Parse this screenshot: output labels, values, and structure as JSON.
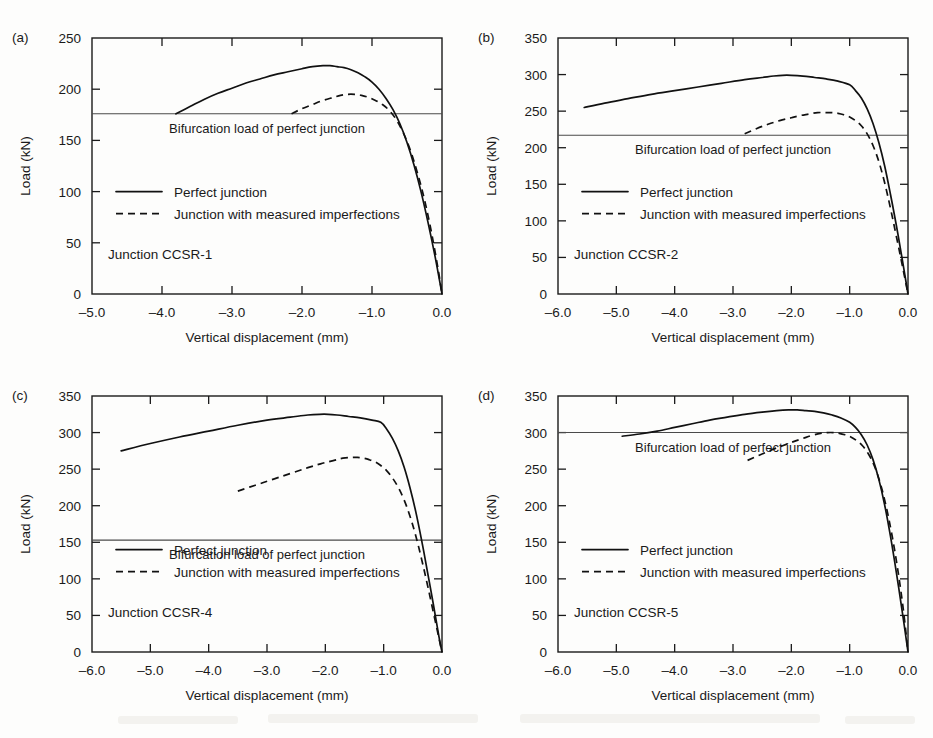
{
  "figure": {
    "background": "#fdfdfc",
    "ink": "#111111",
    "panel_count": 4
  },
  "chart_data": [
    {
      "type": "line",
      "panel_letter": "(a)",
      "title": "",
      "case_label": "Junction CCSR-1",
      "xlabel": "Vertical displacement (mm)",
      "ylabel": "Load (kN)",
      "xlim": [
        -5.0,
        0.0
      ],
      "ylim": [
        0,
        250
      ],
      "xticks": [
        -5.0,
        -4.0,
        -3.0,
        -2.0,
        -1.0,
        0.0
      ],
      "xticklabels": [
        "–5.0",
        "–4.0",
        "–3.0",
        "–2.0",
        "–1.0",
        "0.0"
      ],
      "yticks": [
        0,
        50,
        100,
        150,
        200,
        250
      ],
      "yticklabels": [
        "0",
        "50",
        "100",
        "150",
        "200",
        "250"
      ],
      "grid": false,
      "legend_position": "center-left",
      "annotation": "Bifurcation load of perfect junction",
      "bifurcation_load": 176,
      "series": [
        {
          "name": "Perfect junction",
          "style": "solid",
          "x": [
            -3.8,
            -3.6,
            -3.4,
            -3.2,
            -3.0,
            -2.8,
            -2.6,
            -2.4,
            -2.2,
            -2.0,
            -1.85,
            -1.7,
            -1.6,
            -1.5,
            -1.4,
            -1.3,
            -1.2,
            -1.1,
            -1.0,
            -0.9,
            -0.8,
            -0.7,
            -0.6,
            -0.5,
            -0.4,
            -0.3,
            -0.2,
            -0.1,
            0.0
          ],
          "y": [
            176,
            183,
            190,
            196,
            201,
            206,
            210,
            214,
            217,
            220,
            222,
            223,
            223,
            222,
            221,
            219,
            216,
            212,
            207,
            200,
            191,
            180,
            166,
            148,
            126,
            100,
            70,
            37,
            0
          ]
        },
        {
          "name": "Junction with measured imperfections",
          "style": "dashed",
          "x": [
            -2.15,
            -2.0,
            -1.85,
            -1.7,
            -1.55,
            -1.45,
            -1.35,
            -1.25,
            -1.15,
            -1.05,
            -0.95,
            -0.85,
            -0.75,
            -0.65,
            -0.55,
            -0.45,
            -0.35,
            -0.25,
            -0.15,
            -0.05,
            0.0
          ],
          "y": [
            176,
            181,
            185,
            189,
            192,
            194,
            195,
            195,
            194,
            192,
            189,
            185,
            179,
            170,
            157,
            140,
            118,
            92,
            60,
            22,
            0
          ]
        }
      ]
    },
    {
      "type": "line",
      "panel_letter": "(b)",
      "title": "",
      "case_label": "Junction CCSR-2",
      "xlabel": "Vertical displacement (mm)",
      "ylabel": "Load (kN)",
      "xlim": [
        -6.0,
        0.0
      ],
      "ylim": [
        0,
        350
      ],
      "xticks": [
        -6.0,
        -5.0,
        -4.0,
        -3.0,
        -2.0,
        -1.0,
        0.0
      ],
      "xticklabels": [
        "–6.0",
        "–5.0",
        "–4.0",
        "–3.0",
        "–2.0",
        "–1.0",
        "0.0"
      ],
      "yticks": [
        0,
        50,
        100,
        150,
        200,
        250,
        300,
        350
      ],
      "yticklabels": [
        "0",
        "50",
        "100",
        "150",
        "200",
        "250",
        "300",
        "350"
      ],
      "grid": false,
      "legend_position": "center-left",
      "annotation": "Bifurcation load of perfect junction",
      "bifurcation_load": 217,
      "series": [
        {
          "name": "Perfect junction",
          "style": "solid",
          "x": [
            -5.55,
            -5.2,
            -4.8,
            -4.4,
            -4.0,
            -3.6,
            -3.2,
            -2.8,
            -2.5,
            -2.3,
            -2.15,
            -2.0,
            -1.8,
            -1.6,
            -1.4,
            -1.2,
            -1.0,
            -0.9,
            -0.8,
            -0.7,
            -0.6,
            -0.5,
            -0.4,
            -0.3,
            -0.2,
            -0.1,
            0.0
          ],
          "y": [
            255,
            261,
            267,
            273,
            278,
            283,
            288,
            293,
            296,
            298,
            299,
            299,
            298,
            296,
            294,
            291,
            286,
            278,
            268,
            253,
            233,
            207,
            175,
            136,
            94,
            48,
            0
          ]
        },
        {
          "name": "Junction with measured imperfections",
          "style": "dashed",
          "x": [
            -2.8,
            -2.6,
            -2.4,
            -2.2,
            -2.0,
            -1.85,
            -1.7,
            -1.55,
            -1.4,
            -1.3,
            -1.2,
            -1.1,
            -1.0,
            -0.9,
            -0.8,
            -0.7,
            -0.6,
            -0.5,
            -0.4,
            -0.3,
            -0.2,
            -0.1,
            0.0
          ],
          "y": [
            219,
            226,
            232,
            237,
            241,
            244,
            246,
            248,
            248,
            248,
            247,
            245,
            242,
            237,
            230,
            219,
            203,
            181,
            152,
            117,
            79,
            40,
            0
          ]
        }
      ]
    },
    {
      "type": "line",
      "panel_letter": "(c)",
      "title": "",
      "case_label": "Junction CCSR-4",
      "xlabel": "Vertical displacement (mm)",
      "ylabel": "Load (kN)",
      "xlim": [
        -6.0,
        0.0
      ],
      "ylim": [
        0,
        350
      ],
      "xticks": [
        -6.0,
        -5.0,
        -4.0,
        -3.0,
        -2.0,
        -1.0,
        0.0
      ],
      "xticklabels": [
        "–6.0",
        "–5.0",
        "–4.0",
        "–3.0",
        "–2.0",
        "–1.0",
        "0.0"
      ],
      "yticks": [
        0,
        50,
        100,
        150,
        200,
        250,
        300,
        350
      ],
      "yticklabels": [
        "0",
        "50",
        "100",
        "150",
        "200",
        "250",
        "300",
        "350"
      ],
      "grid": false,
      "legend_position": "center-left",
      "annotation": "Bifurcation load of perfect junction",
      "bifurcation_load": 153,
      "series": [
        {
          "name": "Perfect junction",
          "style": "solid",
          "x": [
            -5.5,
            -5.0,
            -4.5,
            -4.0,
            -3.5,
            -3.0,
            -2.6,
            -2.3,
            -2.1,
            -1.95,
            -1.8,
            -1.6,
            -1.4,
            -1.2,
            -1.05,
            -0.95,
            -0.85,
            -0.75,
            -0.65,
            -0.55,
            -0.45,
            -0.35,
            -0.25,
            -0.15,
            -0.05,
            0.0
          ],
          "y": [
            275,
            285,
            294,
            302,
            310,
            317,
            321,
            324,
            325,
            325,
            324,
            322,
            320,
            317,
            314,
            305,
            292,
            275,
            253,
            225,
            192,
            153,
            110,
            66,
            20,
            0
          ]
        },
        {
          "name": "Junction with measured imperfections",
          "style": "dashed",
          "x": [
            -3.5,
            -3.2,
            -2.9,
            -2.6,
            -2.3,
            -2.05,
            -1.85,
            -1.7,
            -1.55,
            -1.45,
            -1.35,
            -1.25,
            -1.15,
            -1.05,
            -0.95,
            -0.85,
            -0.75,
            -0.65,
            -0.55,
            -0.45,
            -0.35,
            -0.25,
            -0.15,
            -0.05,
            0.0
          ],
          "y": [
            220,
            228,
            236,
            244,
            252,
            258,
            262,
            265,
            266,
            266,
            265,
            263,
            260,
            255,
            248,
            238,
            225,
            208,
            186,
            159,
            127,
            92,
            55,
            18,
            0
          ]
        }
      ]
    },
    {
      "type": "line",
      "panel_letter": "(d)",
      "title": "",
      "case_label": "Junction CCSR-5",
      "xlabel": "Vertical displacement (mm)",
      "ylabel": "Load (kN)",
      "xlim": [
        -6.0,
        0.0
      ],
      "ylim": [
        0,
        350
      ],
      "xticks": [
        -6.0,
        -5.0,
        -4.0,
        -3.0,
        -2.0,
        -1.0,
        0.0
      ],
      "xticklabels": [
        "–6.0",
        "–5.0",
        "–4.0",
        "–3.0",
        "–2.0",
        "–1.0",
        "0.0"
      ],
      "yticks": [
        0,
        50,
        100,
        150,
        200,
        250,
        300,
        350
      ],
      "yticklabels": [
        "0",
        "50",
        "100",
        "150",
        "200",
        "250",
        "300",
        "350"
      ],
      "grid": false,
      "legend_position": "center-left",
      "annotation": "Bifurcation load of perfect junction",
      "bifurcation_load": 300,
      "series": [
        {
          "name": "Perfect junction",
          "style": "solid",
          "x": [
            -4.9,
            -4.6,
            -4.3,
            -4.0,
            -3.7,
            -3.4,
            -3.1,
            -2.8,
            -2.5,
            -2.25,
            -2.05,
            -1.9,
            -1.75,
            -1.6,
            -1.45,
            -1.3,
            -1.15,
            -1.0,
            -0.9,
            -0.8,
            -0.7,
            -0.6,
            -0.5,
            -0.4,
            -0.3,
            -0.2,
            -0.1,
            0.0
          ],
          "y": [
            295,
            298,
            302,
            307,
            312,
            317,
            321,
            325,
            328,
            330,
            331,
            331,
            330,
            329,
            327,
            324,
            320,
            314,
            307,
            297,
            283,
            263,
            236,
            201,
            158,
            109,
            56,
            0
          ]
        },
        {
          "name": "Junction with measured imperfections",
          "style": "dashed",
          "x": [
            -2.75,
            -2.55,
            -2.35,
            -2.15,
            -1.95,
            -1.8,
            -1.65,
            -1.5,
            -1.38,
            -1.28,
            -1.18,
            -1.08,
            -0.98,
            -0.88,
            -0.78,
            -0.68,
            -0.58,
            -0.48,
            -0.38,
            -0.28,
            -0.18,
            -0.08,
            0.0
          ],
          "y": [
            262,
            269,
            276,
            282,
            288,
            292,
            296,
            299,
            300,
            300,
            299,
            297,
            294,
            289,
            282,
            271,
            255,
            232,
            201,
            162,
            115,
            58,
            0
          ]
        }
      ]
    }
  ]
}
